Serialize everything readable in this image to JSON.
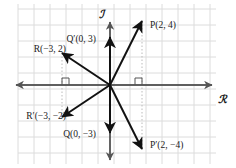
{
  "figure": {
    "kind": "complex-plane-vector-diagram",
    "background": "#ffffff",
    "grid_color": "#dcdcdc",
    "axis_color": "#555555",
    "vector_color": "#111111",
    "guide_color": "#bbbbbb",
    "width": 236,
    "height": 168
  },
  "axes": {
    "real_label": "ℛ",
    "imaginary_label": "ℐ",
    "origin_px": {
      "x": 110,
      "y": 85
    },
    "unit_px": 16,
    "x_range": [
      -6,
      6
    ],
    "y_range": [
      -5,
      5
    ],
    "grid": true
  },
  "points": [
    {
      "id": "P",
      "label": "P(2, 4)",
      "x": 2,
      "y": 4,
      "label_px": {
        "x": 150,
        "y": 28
      },
      "anchor": "start"
    },
    {
      "id": "Pprime",
      "label": "P′(2, −4)",
      "x": 2,
      "y": -4,
      "label_px": {
        "x": 150,
        "y": 148
      },
      "anchor": "start"
    },
    {
      "id": "Qprime",
      "label": "Q′(0, 3)",
      "x": 0,
      "y": 3,
      "label_px": {
        "x": 96,
        "y": 42
      },
      "anchor": "end"
    },
    {
      "id": "Q",
      "label": "Q(0, −3)",
      "x": 0,
      "y": -3,
      "label_px": {
        "x": 96,
        "y": 137
      },
      "anchor": "end"
    },
    {
      "id": "R",
      "label": "R(−3, 2)",
      "x": -3,
      "y": 2,
      "label_px": {
        "x": 66,
        "y": 52
      },
      "anchor": "end"
    },
    {
      "id": "Rprime",
      "label": "R′(−3, −2)",
      "x": -3,
      "y": -2,
      "label_px": {
        "x": 66,
        "y": 119
      },
      "anchor": "end"
    }
  ],
  "guides": [
    {
      "id": "guide-P",
      "x": 2,
      "from_y": 4,
      "to_y": -4
    },
    {
      "id": "guide-R",
      "x": -3,
      "from_y": 2,
      "to_y": -2
    }
  ],
  "right_angle_marks": [
    {
      "id": "right-angle-positive-x",
      "x": 2,
      "side": "above"
    },
    {
      "id": "right-angle-negative-x",
      "x": -3,
      "side": "above"
    }
  ]
}
